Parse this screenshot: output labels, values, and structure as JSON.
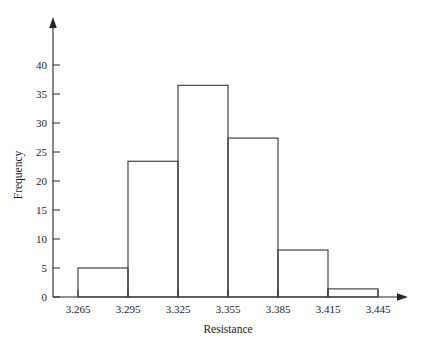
{
  "chart_data": {
    "type": "bar",
    "title": "",
    "subtitle": "",
    "xlabel": "Resistance",
    "ylabel": "Frequency",
    "grid": false,
    "legend": false,
    "legend_position": "none",
    "bin_edges": [
      3.265,
      3.295,
      3.325,
      3.355,
      3.385,
      3.415,
      3.445
    ],
    "bin_width": 0.03,
    "categories": [
      "3.265-3.295",
      "3.295-3.325",
      "3.325-3.355",
      "3.355-3.385",
      "3.385-3.415",
      "3.415-3.445"
    ],
    "values": [
      5,
      23.4,
      36.5,
      27.4,
      8.1,
      1.4
    ],
    "xlim": [
      3.265,
      3.445
    ],
    "ylim": [
      0,
      42
    ],
    "xticks": [
      "3.265",
      "3.295",
      "3.325",
      "3.355",
      "3.385",
      "3.415",
      "3.445"
    ],
    "yticks": [
      "0",
      "5",
      "10",
      "15",
      "20",
      "25",
      "30",
      "35",
      "40"
    ],
    "ytick_values": [
      0,
      5,
      10,
      15,
      20,
      25,
      30,
      35,
      40
    ],
    "bar_style": "unfilled-outline",
    "colors": {
      "background": "#ffffff",
      "axis": "#262626",
      "bar_outline": "#3a3a3a",
      "text": "#1a1a1a"
    },
    "annotations": []
  }
}
